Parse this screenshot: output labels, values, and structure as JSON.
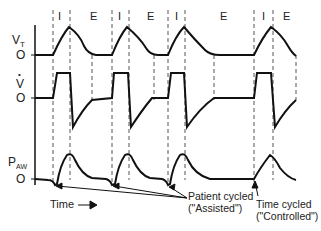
{
  "diagram": {
    "phase_labels": [
      "I",
      "E",
      "I",
      "E",
      "I",
      "E",
      "I",
      "E"
    ],
    "axes": {
      "vt_label": "V",
      "vt_sub": "T",
      "flow_label": "V",
      "flow_dot": "•",
      "paw_label": "P",
      "paw_sub": "AW",
      "zero_label": "O"
    },
    "time_label": "Time",
    "annotations": {
      "patient_line1": "Patient cycled",
      "patient_line2": "(\"Assisted\")",
      "time_line1": "Time cycled",
      "time_line2": "(\"Controlled\")"
    },
    "colors": {
      "line": "#111111",
      "dash": "#555555",
      "text": "#222222"
    }
  }
}
